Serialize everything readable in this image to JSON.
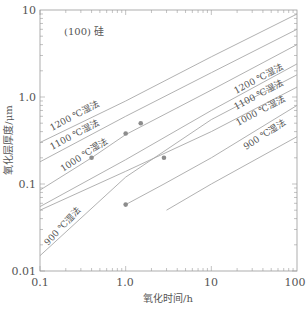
{
  "chart_data": {
    "type": "line",
    "title": "",
    "annotation": "(100) 硅",
    "xlabel": "氧化时间/h",
    "ylabel": "氧化层厚度/μm",
    "xscale": "log",
    "yscale": "log",
    "xlim": [
      0.1,
      100
    ],
    "ylim": [
      0.01,
      10
    ],
    "xticks": [
      "0.1",
      "1.0",
      "10",
      "100"
    ],
    "yticks": [
      "0.01",
      "0.1",
      "1.0",
      "10"
    ],
    "grid": false,
    "colors": {
      "line": "#a8a8a8",
      "axis": "#9a9a9a",
      "marker": "#8c8c8c",
      "text": "#555555"
    },
    "series": [
      {
        "name": "1200 ℃湿法",
        "group": "left",
        "x": [
          0.1,
          1,
          10,
          100
        ],
        "y": [
          0.3,
          0.9,
          2.9,
          9.0
        ]
      },
      {
        "name": "1100 ℃湿法",
        "group": "left",
        "x": [
          0.1,
          1,
          10,
          100
        ],
        "y": [
          0.18,
          0.6,
          1.9,
          6.0
        ]
      },
      {
        "name": "1000 ℃湿法",
        "group": "left",
        "x": [
          0.1,
          0.4,
          1,
          10,
          100
        ],
        "y": [
          0.085,
          0.2,
          0.37,
          1.2,
          4.0
        ]
      },
      {
        "name": "900 ℃湿法",
        "group": "left",
        "x": [
          0.1,
          1,
          10,
          100
        ],
        "y": [
          0.055,
          0.19,
          0.7,
          2.4
        ]
      },
      {
        "name": "1200 ℃湿法",
        "group": "right",
        "x": [
          0.1,
          1,
          10,
          100
        ],
        "y": [
          0.015,
          0.12,
          0.55,
          1.8
        ]
      },
      {
        "name": "1100 ℃湿法",
        "group": "right",
        "x": [
          0.1,
          1,
          10,
          100
        ],
        "y": [
          0.05,
          0.14,
          0.4,
          1.3
        ]
      },
      {
        "name": "1000 ℃湿法",
        "group": "right",
        "x": [
          1,
          2.8,
          10,
          100
        ],
        "y": [
          0.058,
          0.1,
          0.2,
          0.8
        ]
      },
      {
        "name": "900 ℃湿法",
        "group": "right",
        "x": [
          3,
          10,
          100
        ],
        "y": [
          0.05,
          0.1,
          0.35
        ]
      }
    ],
    "markers": [
      {
        "x": 0.4,
        "y": 0.2
      },
      {
        "x": 1.0,
        "y": 0.38
      },
      {
        "x": 1.5,
        "y": 0.5
      },
      {
        "x": 2.8,
        "y": 0.2
      },
      {
        "x": 1.0,
        "y": 0.058
      }
    ]
  }
}
